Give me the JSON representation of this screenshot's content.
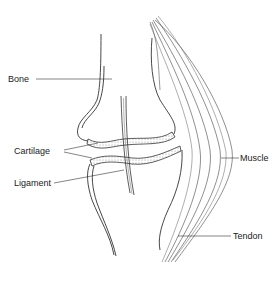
{
  "diagram": {
    "labels": [
      {
        "id": "bone",
        "text": "Bone"
      },
      {
        "id": "cartilage",
        "text": "Cartilage"
      },
      {
        "id": "ligament",
        "text": "Ligament"
      },
      {
        "id": "muscle",
        "text": "Muscle"
      },
      {
        "id": "tendon",
        "text": "Tendon"
      }
    ]
  }
}
